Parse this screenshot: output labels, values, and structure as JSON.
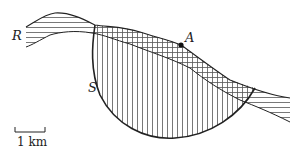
{
  "diagram": {
    "type": "geological-cross-section",
    "labels": {
      "layer": "R",
      "slip_surface": "S",
      "point": "A"
    },
    "scale_bar": {
      "label": "1 km"
    },
    "colors": {
      "stroke": "#222222",
      "hatch": "#555555",
      "background": "#ffffff"
    },
    "legend": [
      {
        "pattern": "horizontal-hatch",
        "meaning": "layer R"
      },
      {
        "pattern": "vertical-hatch",
        "meaning": "slip mass within circle S"
      },
      {
        "pattern": "cross-hatch",
        "meaning": "layer R within slip mass"
      }
    ]
  }
}
